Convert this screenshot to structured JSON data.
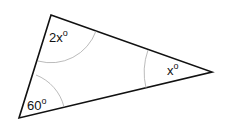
{
  "diagram": {
    "type": "triangle",
    "vertices": {
      "top": [
        51,
        15
      ],
      "right": [
        212,
        72
      ],
      "bottom_left": [
        19,
        118
      ]
    },
    "angles": [
      {
        "vertex": "top",
        "label": "2x",
        "unit": "o"
      },
      {
        "vertex": "right",
        "label": "x",
        "unit": "o"
      },
      {
        "vertex": "bottom_left",
        "label": "60",
        "unit": "o"
      }
    ],
    "colors": {
      "edge": "#111111",
      "arc": "#aaaaaa",
      "background": "#ffffff"
    }
  }
}
